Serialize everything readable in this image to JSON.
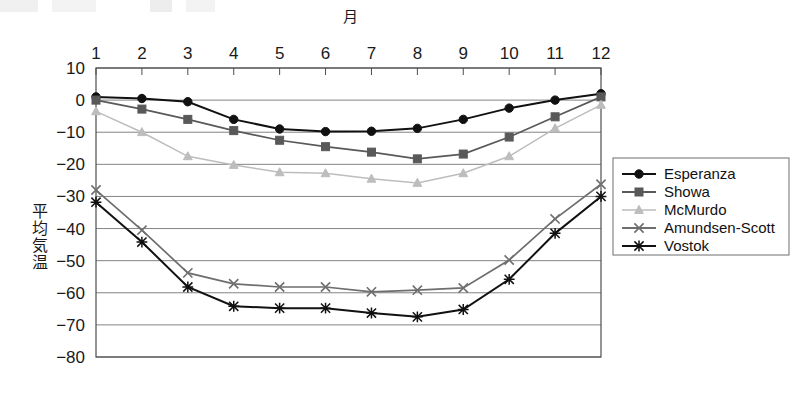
{
  "chart_data": {
    "type": "line",
    "title": "",
    "xlabel": "月",
    "ylabel": "平均気温",
    "categories": [
      "1",
      "2",
      "3",
      "4",
      "5",
      "6",
      "7",
      "8",
      "9",
      "10",
      "11",
      "12"
    ],
    "x": [
      1,
      2,
      3,
      4,
      5,
      6,
      7,
      8,
      9,
      10,
      11,
      12
    ],
    "xlim": [
      1,
      12
    ],
    "ylim": [
      -80,
      10
    ],
    "ytick_labels": [
      "10",
      "0",
      "−10",
      "−20",
      "−30",
      "−40",
      "−50",
      "−60",
      "−70",
      "−80"
    ],
    "yticks": [
      10,
      0,
      -10,
      -20,
      -30,
      -40,
      -50,
      -60,
      -70,
      -80
    ],
    "grid": true,
    "x_axis_position": "top",
    "legend_position": "right",
    "series": [
      {
        "name": "Esperanza",
        "marker": "circle",
        "color": "#111111",
        "values": [
          1.0,
          0.5,
          -0.5,
          -6.0,
          -9.0,
          -9.8,
          -9.7,
          -8.8,
          -6.0,
          -2.5,
          0.0,
          2.0
        ]
      },
      {
        "name": "Showa",
        "marker": "square",
        "color": "#595959",
        "values": [
          0.0,
          -2.8,
          -6.0,
          -9.5,
          -12.5,
          -14.5,
          -16.2,
          -18.3,
          -16.8,
          -11.5,
          -5.2,
          1.0
        ]
      },
      {
        "name": "McMurdo",
        "marker": "triangle",
        "color": "#bdbdbd",
        "values": [
          -3.5,
          -10.0,
          -17.5,
          -20.2,
          -22.5,
          -22.8,
          -24.5,
          -25.8,
          -22.8,
          -17.5,
          -8.8,
          -1.5
        ]
      },
      {
        "name": "Amundsen-Scott",
        "marker": "cross",
        "color": "#6e6e6e",
        "values": [
          -28.0,
          -40.5,
          -53.8,
          -57.2,
          -58.2,
          -58.2,
          -59.7,
          -59.2,
          -58.5,
          -49.8,
          -37.0,
          -26.2
        ]
      },
      {
        "name": "Vostok",
        "marker": "asterisk",
        "color": "#111111",
        "values": [
          -31.8,
          -44.2,
          -58.2,
          -64.2,
          -64.8,
          -64.8,
          -66.3,
          -67.5,
          -65.2,
          -55.8,
          -41.5,
          -30.0
        ]
      }
    ]
  }
}
